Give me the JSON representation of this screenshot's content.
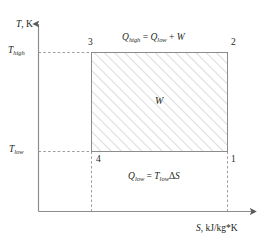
{
  "figure": {
    "kind": "temperature-entropy-diagram",
    "axes": {
      "y_label_symbol": "T",
      "y_label_unit": ", K",
      "x_label_symbol": "S",
      "x_label_unit": ", kJ/kg*K"
    },
    "ticks": {
      "y_high_symbol": "T",
      "y_high_sub": "high",
      "y_low_symbol": "T",
      "y_low_sub": "low"
    },
    "corners": {
      "top_left": "3",
      "top_right": "2",
      "bottom_left": "4",
      "bottom_right": "1"
    },
    "annotations": {
      "top_equation": {
        "lhs_symbol": "Q",
        "lhs_sub": "high",
        "eq": " = ",
        "rhs_symbol": "Q",
        "rhs_sub": "low",
        "plus": " + ",
        "work_symbol": "W"
      },
      "bottom_equation": {
        "lhs_symbol": "Q",
        "lhs_sub": "low",
        "eq": " = ",
        "rhs_symbol": "T",
        "rhs_sub": "low",
        "delta": "Δ",
        "entropy_symbol": "S"
      },
      "area_label": "W"
    },
    "colors": {
      "stroke": "#808080",
      "text": "#231f20",
      "hatch": "#d9d9d9",
      "fill": "#ffffff",
      "background": "#ffffff"
    },
    "geometry": {
      "origin_x": 38,
      "origin_y": 212,
      "y_axis_top": 18,
      "x_axis_right": 262,
      "rect_left": 91,
      "rect_right": 228,
      "rect_top": 52,
      "rect_bottom": 152
    }
  }
}
